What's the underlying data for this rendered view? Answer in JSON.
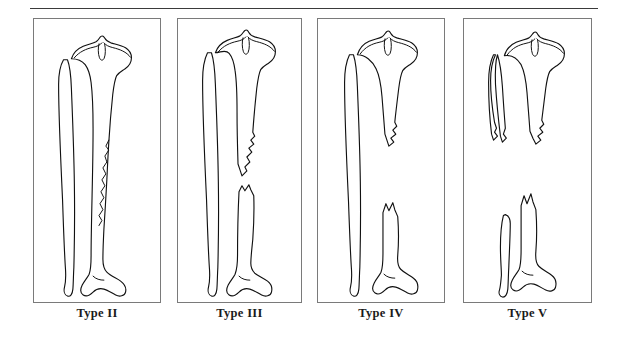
{
  "figure": {
    "caption_rule": "horizontal-rule",
    "background_color": "#ffffff",
    "line_color": "#111111",
    "panel_border_color": "#7a7a7a",
    "label_color": "#1a1a1a"
  },
  "panels": [
    {
      "id": "panel-type-2",
      "label": "Type II",
      "anatomy": "tibia-and-fibula",
      "fracture_pattern": "long-oblique-comminuted-tibial-shaft",
      "fibula": "intact",
      "bone_loss": "none"
    },
    {
      "id": "panel-type-3",
      "label": "Type III",
      "anatomy": "tibia-and-fibula",
      "fracture_pattern": "segmental-tibial-shaft-with-gap",
      "fibula": "intact",
      "bone_loss": "small-segmental-gap"
    },
    {
      "id": "panel-type-4",
      "label": "Type IV",
      "anatomy": "tibia-and-fibula",
      "fracture_pattern": "large-segmental-tibial-defect",
      "fibula": "intact",
      "bone_loss": "large-segmental-gap"
    },
    {
      "id": "panel-type-5",
      "label": "Type V",
      "anatomy": "tibia-and-fibula",
      "fracture_pattern": "massive-segmental-loss-of-tibia-and-fibula",
      "fibula": "discontinuous",
      "bone_loss": "massive-segmental-gap"
    }
  ]
}
